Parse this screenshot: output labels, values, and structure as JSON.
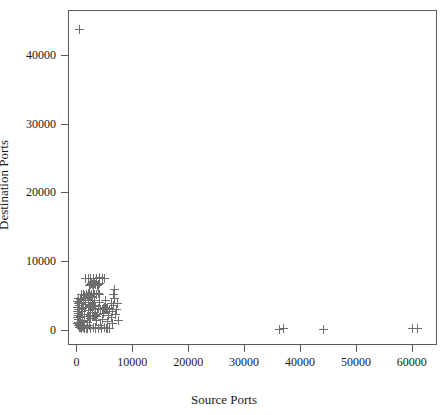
{
  "chart_data": {
    "type": "scatter",
    "title": "",
    "xlabel": "Source Ports",
    "ylabel": "Destination Ports",
    "xlim": [
      -1500,
      64500
    ],
    "ylim": [
      -2200,
      46500
    ],
    "xticks": [
      0,
      10000,
      20000,
      30000,
      40000,
      50000,
      60000
    ],
    "yticks": [
      0,
      10000,
      20000,
      30000,
      40000
    ],
    "xtick_labels": [
      "0",
      "10000",
      "20000",
      "30000",
      "40000",
      "50000",
      "60000"
    ],
    "ytick_labels": [
      "0",
      "10000",
      "20000",
      "30000",
      "40000"
    ],
    "grid": false,
    "legend": null,
    "marker": "+",
    "marker_color": "#6e6e6e",
    "series": [
      {
        "name": "ports",
        "points": [
          [
            500,
            43700
          ],
          [
            36400,
            100
          ],
          [
            37000,
            150
          ],
          [
            44200,
            120
          ],
          [
            60200,
            180
          ],
          [
            61000,
            130
          ],
          [
            250,
            900
          ],
          [
            250,
            1800
          ],
          [
            250,
            2600
          ],
          [
            250,
            3300
          ],
          [
            250,
            4100
          ],
          [
            300,
            1100
          ],
          [
            320,
            2100
          ],
          [
            340,
            3000
          ],
          [
            360,
            3900
          ],
          [
            380,
            4600
          ],
          [
            420,
            600
          ],
          [
            440,
            1500
          ],
          [
            460,
            2400
          ],
          [
            480,
            3200
          ],
          [
            500,
            4000
          ],
          [
            520,
            850
          ],
          [
            560,
            1750
          ],
          [
            600,
            2650
          ],
          [
            640,
            3500
          ],
          [
            680,
            4350
          ],
          [
            700,
            300
          ],
          [
            760,
            1000
          ],
          [
            820,
            2000
          ],
          [
            880,
            2900
          ],
          [
            940,
            3800
          ],
          [
            1000,
            250
          ],
          [
            1060,
            1200
          ],
          [
            1120,
            2200
          ],
          [
            1180,
            3100
          ],
          [
            1240,
            4050
          ],
          [
            1300,
            500
          ],
          [
            1400,
            1400
          ],
          [
            1500,
            2300
          ],
          [
            1600,
            3300
          ],
          [
            1700,
            4200
          ],
          [
            1800,
            180
          ],
          [
            1900,
            1050
          ],
          [
            2000,
            1950
          ],
          [
            2100,
            2850
          ],
          [
            2200,
            3750
          ],
          [
            2300,
            6500
          ],
          [
            2500,
            6600
          ],
          [
            2700,
            6700
          ],
          [
            2900,
            6550
          ],
          [
            3100,
            6620
          ],
          [
            3300,
            6680
          ],
          [
            3500,
            6600
          ],
          [
            3700,
            6520
          ],
          [
            3900,
            6640
          ],
          [
            4100,
            6700
          ],
          [
            2400,
            700
          ],
          [
            2600,
            1600
          ],
          [
            2800,
            2500
          ],
          [
            3000,
            3400
          ],
          [
            3200,
            4300
          ],
          [
            3400,
            400
          ],
          [
            3600,
            1300
          ],
          [
            3800,
            2200
          ],
          [
            4000,
            3100
          ],
          [
            4200,
            4000
          ],
          [
            4400,
            600
          ],
          [
            4600,
            1500
          ],
          [
            4800,
            2400
          ],
          [
            5000,
            3300
          ],
          [
            5200,
            4200
          ],
          [
            5400,
            250
          ],
          [
            5600,
            1150
          ],
          [
            5800,
            2050
          ],
          [
            6000,
            2950
          ],
          [
            6200,
            3850
          ],
          [
            1500,
            200
          ],
          [
            2000,
            250
          ],
          [
            2500,
            180
          ],
          [
            3000,
            300
          ],
          [
            3500,
            220
          ],
          [
            4000,
            260
          ],
          [
            4500,
            200
          ],
          [
            5000,
            280
          ],
          [
            5500,
            230
          ],
          [
            6000,
            190
          ],
          [
            1600,
            7400
          ],
          [
            2100,
            7500
          ],
          [
            2600,
            7450
          ],
          [
            3100,
            7520
          ],
          [
            3600,
            7480
          ],
          [
            4100,
            7550
          ],
          [
            4600,
            7420
          ],
          [
            5100,
            7500
          ],
          [
            6300,
            1800
          ],
          [
            6500,
            2700
          ],
          [
            6700,
            3600
          ],
          [
            6900,
            4500
          ],
          [
            6400,
            900
          ],
          [
            6600,
            5200
          ],
          [
            6800,
            5800
          ],
          [
            7000,
            2200
          ],
          [
            7200,
            3000
          ],
          [
            7400,
            3900
          ],
          [
            7500,
            1400
          ],
          [
            900,
            5100
          ],
          [
            1200,
            5200
          ],
          [
            1500,
            5050
          ],
          [
            1800,
            5150
          ],
          [
            2100,
            5250
          ],
          [
            2400,
            5100
          ],
          [
            2700,
            5200
          ],
          [
            3000,
            5300
          ],
          [
            3300,
            5150
          ],
          [
            3600,
            5080
          ],
          [
            3900,
            5220
          ],
          [
            4200,
            5180
          ],
          [
            600,
            350
          ],
          [
            700,
            420
          ],
          [
            800,
            380
          ],
          [
            900,
            450
          ],
          [
            1000,
            400
          ],
          [
            1100,
            470
          ],
          [
            1200,
            430
          ],
          [
            1300,
            390
          ],
          [
            1400,
            460
          ],
          [
            1500,
            410
          ],
          [
            2200,
            1900
          ],
          [
            2400,
            2000
          ],
          [
            2600,
            2100
          ],
          [
            2800,
            2050
          ],
          [
            3000,
            1950
          ],
          [
            3200,
            2150
          ],
          [
            3400,
            2080
          ],
          [
            3600,
            1980
          ],
          [
            4400,
            2900
          ],
          [
            4600,
            3000
          ],
          [
            4800,
            3100
          ],
          [
            5000,
            3050
          ],
          [
            5200,
            2950
          ],
          [
            5400,
            3150
          ],
          [
            5600,
            3080
          ],
          [
            2300,
            3400
          ],
          [
            2500,
            3500
          ],
          [
            2700,
            3450
          ],
          [
            2900,
            3520
          ],
          [
            3100,
            3480
          ],
          [
            3300,
            3550
          ],
          [
            3500,
            3420
          ],
          [
            1700,
            4700
          ],
          [
            1900,
            4800
          ],
          [
            2100,
            4750
          ],
          [
            2300,
            4820
          ],
          [
            2500,
            4780
          ],
          [
            2700,
            4850
          ],
          [
            2900,
            4720
          ]
        ]
      }
    ]
  }
}
